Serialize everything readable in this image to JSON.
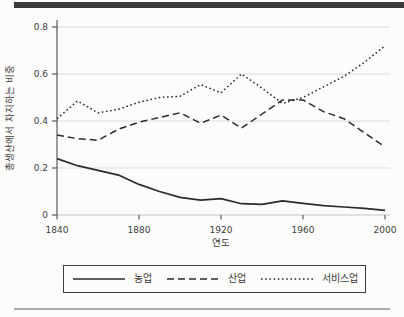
{
  "figure": {
    "background": "#fcfcfa",
    "top_rule_color": "#3a3a3a",
    "bottom_rule_color": "#ababa9"
  },
  "chart_data": {
    "type": "line",
    "title": "",
    "xlabel": "연도",
    "ylabel": "총생산에서 차지하는 비중",
    "x": [
      1840,
      1850,
      1860,
      1870,
      1880,
      1890,
      1900,
      1910,
      1920,
      1930,
      1940,
      1950,
      1960,
      1970,
      1980,
      1990,
      2000
    ],
    "series": [
      {
        "name": "농업",
        "line_style": "solid",
        "values": [
          0.24,
          0.21,
          0.19,
          0.17,
          0.13,
          0.1,
          0.075,
          0.063,
          0.07,
          0.048,
          0.045,
          0.06,
          0.05,
          0.04,
          0.034,
          0.028,
          0.02
        ]
      },
      {
        "name": "산업",
        "line_style": "dashed",
        "values": [
          0.34,
          0.325,
          0.318,
          0.365,
          0.395,
          0.415,
          0.435,
          0.39,
          0.425,
          0.37,
          0.43,
          0.49,
          0.49,
          0.44,
          0.41,
          0.35,
          0.29
        ]
      },
      {
        "name": "서비스업",
        "line_style": "dotted",
        "values": [
          0.41,
          0.485,
          0.435,
          0.45,
          0.48,
          0.5,
          0.505,
          0.555,
          0.52,
          0.6,
          0.54,
          0.475,
          0.5,
          0.545,
          0.59,
          0.65,
          0.72
        ]
      }
    ],
    "xticks": [
      1840,
      1880,
      1920,
      1960,
      2000
    ],
    "yticks": [
      0,
      0.2,
      0.4,
      0.6,
      0.8
    ],
    "xlim": [
      1840,
      2000
    ],
    "ylim": [
      0,
      0.8
    ],
    "grid": "horizontal",
    "legend_position": "bottom",
    "colors": {
      "line": "#2b2b2b",
      "grid": "#dedddb",
      "baseline": "#c6c5c3",
      "axis": "#3c3c3c"
    }
  }
}
